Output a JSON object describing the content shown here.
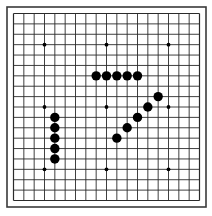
{
  "board": {
    "size": 19,
    "colors": {
      "background": "#ffffff",
      "line": "#2a2a2a",
      "frame": "#3a3a3a",
      "stone_black": "#000000",
      "star_point": "#000000"
    },
    "star_points": [
      [
        3,
        3
      ],
      [
        9,
        3
      ],
      [
        15,
        3
      ],
      [
        3,
        9
      ],
      [
        9,
        9
      ],
      [
        15,
        9
      ],
      [
        3,
        15
      ],
      [
        9,
        15
      ],
      [
        15,
        15
      ]
    ],
    "stones": [
      {
        "color": "black",
        "col": 8,
        "row": 6
      },
      {
        "color": "black",
        "col": 9,
        "row": 6
      },
      {
        "color": "black",
        "col": 10,
        "row": 6
      },
      {
        "color": "black",
        "col": 11,
        "row": 6
      },
      {
        "color": "black",
        "col": 12,
        "row": 6
      },
      {
        "color": "black",
        "col": 14,
        "row": 8
      },
      {
        "color": "black",
        "col": 13,
        "row": 9
      },
      {
        "color": "black",
        "col": 12,
        "row": 10
      },
      {
        "color": "black",
        "col": 11,
        "row": 11
      },
      {
        "color": "black",
        "col": 10,
        "row": 12
      },
      {
        "color": "black",
        "col": 4,
        "row": 10
      },
      {
        "color": "black",
        "col": 4,
        "row": 11
      },
      {
        "color": "black",
        "col": 4,
        "row": 12
      },
      {
        "color": "black",
        "col": 4,
        "row": 13
      },
      {
        "color": "black",
        "col": 4,
        "row": 14
      }
    ]
  }
}
